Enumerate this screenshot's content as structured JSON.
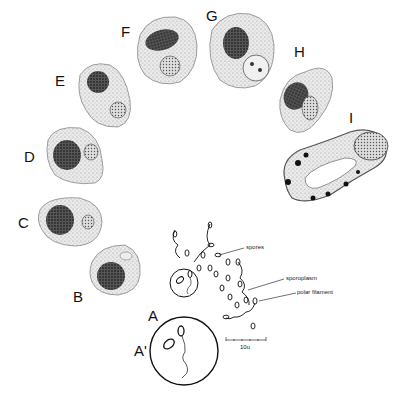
{
  "figure": {
    "stage_labels": [
      {
        "id": "A",
        "text": "A"
      },
      {
        "id": "A-prime",
        "text": "A'"
      },
      {
        "id": "B",
        "text": "B"
      },
      {
        "id": "C",
        "text": "C"
      },
      {
        "id": "D",
        "text": "D"
      },
      {
        "id": "E",
        "text": "E"
      },
      {
        "id": "F",
        "text": "F"
      },
      {
        "id": "G",
        "text": "G"
      },
      {
        "id": "H",
        "text": "H"
      },
      {
        "id": "I",
        "text": "I"
      }
    ],
    "annotations": {
      "spores": "spores",
      "sporoplasm": "sporoplasm",
      "polar_filament": "polar filament"
    },
    "scale_bar": {
      "label": "10u"
    },
    "colors": {
      "ink": "#111111",
      "cell_fill": "#e4e4e4",
      "nucleus": "#2a2a2a",
      "background": "#ffffff"
    }
  }
}
